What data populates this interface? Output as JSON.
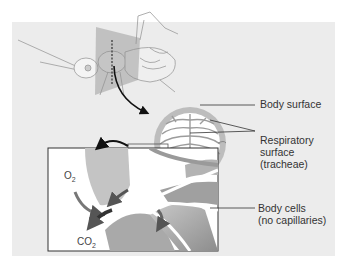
{
  "diagram": {
    "labels": {
      "body_surface": "Body surface",
      "respiratory_surface_line1": "Respiratory",
      "respiratory_surface_line2": "surface",
      "respiratory_surface_line3": "(tracheae)",
      "body_cells_line1": "Body cells",
      "body_cells_line2": "(no capillaries)"
    },
    "chemicals": {
      "oxygen": "O",
      "oxygen_sub": "2",
      "carbon_dioxide": "CO",
      "carbon_dioxide_sub": "2"
    },
    "colors": {
      "panel_bg": "#ececec",
      "ring": "#b5b5b5",
      "tissue_dark": "#8a8a8a",
      "tissue_mid": "#b8b8b8",
      "arrow": "#4a4a4a",
      "text": "#333333"
    }
  }
}
